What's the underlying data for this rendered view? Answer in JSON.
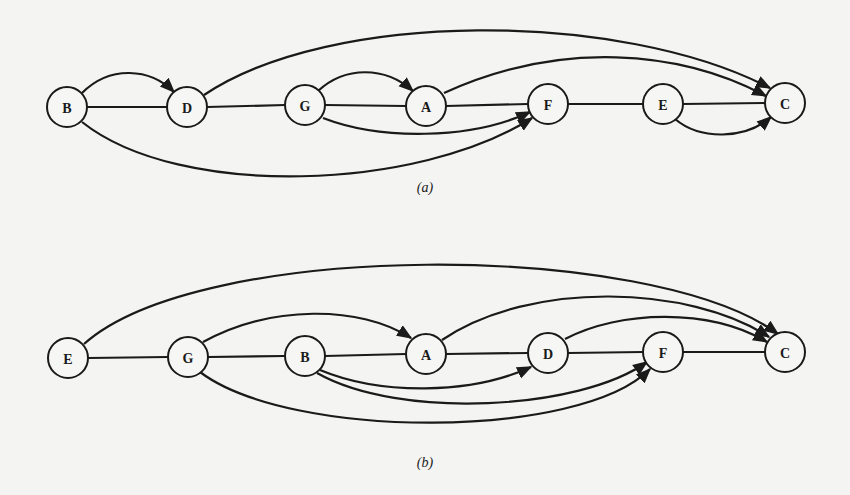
{
  "figure": {
    "panels": [
      {
        "id": "a",
        "caption": "(a)",
        "caption_pos": [
          425,
          192
        ],
        "nodes": [
          {
            "id": "B",
            "label": "B",
            "x": 67,
            "y": 107
          },
          {
            "id": "D",
            "label": "D",
            "x": 187,
            "y": 107
          },
          {
            "id": "G",
            "label": "G",
            "x": 305,
            "y": 105
          },
          {
            "id": "A",
            "label": "A",
            "x": 426,
            "y": 106
          },
          {
            "id": "F",
            "label": "F",
            "x": 548,
            "y": 104
          },
          {
            "id": "E",
            "label": "E",
            "x": 663,
            "y": 104
          },
          {
            "id": "C",
            "label": "C",
            "x": 785,
            "y": 103
          }
        ],
        "chain_edges": [
          [
            "B",
            "D"
          ],
          [
            "D",
            "G"
          ],
          [
            "G",
            "A"
          ],
          [
            "A",
            "F"
          ],
          [
            "F",
            "E"
          ],
          [
            "E",
            "C"
          ]
        ],
        "arc_edges": [
          {
            "from": "B",
            "to": "D",
            "path": "M 82 93 C 110 65, 150 68, 174 92",
            "arrow": true
          },
          {
            "from": "D",
            "to": "C",
            "path": "M 204 95 C 330 10, 620 10, 770 88",
            "arrow": true
          },
          {
            "from": "G",
            "to": "A",
            "path": "M 318 91 C 345 66, 385 66, 413 91",
            "arrow": true
          },
          {
            "from": "A",
            "to": "C",
            "path": "M 444 93 C 560 40, 680 50, 766 96",
            "arrow": true
          },
          {
            "from": "G",
            "to": "F",
            "path": "M 323 118 C 380 140, 470 140, 530 112",
            "arrow": true
          },
          {
            "from": "B",
            "to": "F",
            "path": "M 82 122 C 180 200, 420 190, 532 118",
            "arrow": true
          },
          {
            "from": "E",
            "to": "C",
            "path": "M 675 119 C 700 140, 745 140, 771 117",
            "arrow": true
          }
        ]
      },
      {
        "id": "b",
        "caption": "(b)",
        "caption_pos": [
          425,
          467
        ],
        "nodes": [
          {
            "id": "E",
            "label": "E",
            "x": 68,
            "y": 358
          },
          {
            "id": "G",
            "label": "G",
            "x": 188,
            "y": 357
          },
          {
            "id": "B",
            "label": "B",
            "x": 305,
            "y": 356
          },
          {
            "id": "A",
            "label": "A",
            "x": 426,
            "y": 354
          },
          {
            "id": "D",
            "label": "D",
            "x": 548,
            "y": 353
          },
          {
            "id": "F",
            "label": "F",
            "x": 663,
            "y": 352
          },
          {
            "id": "C",
            "label": "C",
            "x": 785,
            "y": 352
          }
        ],
        "chain_edges": [
          [
            "E",
            "G"
          ],
          [
            "G",
            "B"
          ],
          [
            "B",
            "A"
          ],
          [
            "A",
            "D"
          ],
          [
            "D",
            "F"
          ],
          [
            "F",
            "C"
          ]
        ],
        "arc_edges": [
          {
            "from": "E",
            "to": "C",
            "path": "M 84 344 C 200 240, 650 240, 778 334",
            "arrow": true
          },
          {
            "from": "G",
            "to": "A",
            "path": "M 203 342 C 270 305, 360 305, 411 338",
            "arrow": true
          },
          {
            "from": "A",
            "to": "C",
            "path": "M 442 340 C 530 280, 690 285, 769 337",
            "arrow": true
          },
          {
            "from": "D",
            "to": "F_C",
            "path": "M 565 339 C 620 310, 710 308, 767 342",
            "arrow": true
          },
          {
            "from": "B",
            "to": "D",
            "path": "M 320 370 C 380 395, 470 395, 531 367",
            "arrow": true
          },
          {
            "from": "B",
            "to": "F",
            "path": "M 317 373 C 400 420, 580 410, 647 362",
            "arrow": true
          },
          {
            "from": "G",
            "to": "F",
            "path": "M 200 372 C 290 440, 580 440, 650 369",
            "arrow": true
          }
        ]
      }
    ]
  }
}
